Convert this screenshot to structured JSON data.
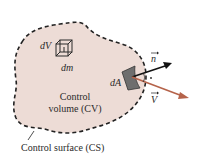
{
  "diagram": {
    "type": "control-volume",
    "labels": {
      "dV": "dV",
      "dm": "dm",
      "dA": "dA",
      "n": "n",
      "V": "V",
      "cv_line1": "Control",
      "cv_line2": "volume (CV)",
      "cs": "Control surface (CS)"
    },
    "colors": {
      "region_fill": "#eddcd6",
      "boundary": "#222222",
      "normal_arrow": "#111111",
      "velocity_arrow": "#b5634a",
      "patch": "#6e6e6e"
    }
  }
}
